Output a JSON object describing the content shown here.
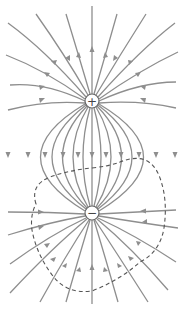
{
  "figure": {
    "colors": {
      "field_line": "#8e8e8e",
      "dashed_surface": "#555555",
      "charge_outline": "#666666",
      "background": "#ffffff"
    },
    "charges": [
      {
        "name": "positive-charge",
        "symbol": "+",
        "x": 92,
        "y": 101,
        "r": 7
      },
      {
        "name": "negative-charge",
        "symbol": "−",
        "x": 92,
        "y": 213,
        "r": 7
      }
    ],
    "surface": {
      "name": "gaussian-surface",
      "style": "dashed",
      "encloses": "negative-charge"
    }
  }
}
